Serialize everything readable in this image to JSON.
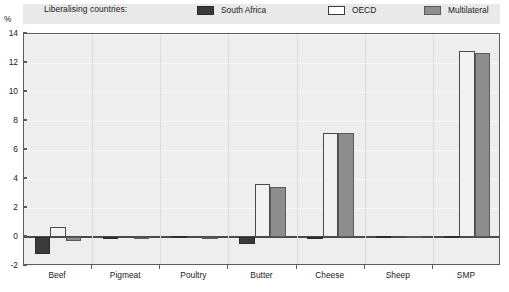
{
  "legend": {
    "title": "Liberalising countries:",
    "entries": [
      {
        "label": "South Africa",
        "swatch": "dark-filled-swatch",
        "color": "#3a3a3a"
      },
      {
        "label": "OECD",
        "swatch": "white-outlined-swatch",
        "color": "#ffffff"
      },
      {
        "label": "Multilateral",
        "swatch": "gray-filled-swatch",
        "color": "#8e8e8e"
      }
    ]
  },
  "axis": {
    "unit": "%",
    "y_ticks": [
      "14",
      "12",
      "10",
      "8",
      "6",
      "4",
      "2",
      "0",
      "-2"
    ]
  },
  "chart_data": {
    "type": "bar",
    "title": "",
    "xlabel": "",
    "ylabel": "%",
    "ylim": [
      -2,
      14
    ],
    "ytick_step": 2,
    "grid": true,
    "legend_position": "top",
    "categories": [
      "Beef",
      "Pigmeat",
      "Poultry",
      "Butter",
      "Cheese",
      "Sheep",
      "SMP"
    ],
    "series": [
      {
        "name": "South Africa",
        "color": "#3a3a3a",
        "values": [
          -1.2,
          -0.02,
          0.0,
          -0.5,
          -0.1,
          0.0,
          0.0
        ]
      },
      {
        "name": "OECD",
        "color": "#f2f2f2",
        "values": [
          0.7,
          0.0,
          0.0,
          3.65,
          7.15,
          0.0,
          12.8
        ]
      },
      {
        "name": "Multilateral",
        "color": "#8e8e8e",
        "values": [
          -0.3,
          -0.03,
          -0.15,
          3.45,
          7.15,
          0.0,
          12.7
        ]
      }
    ]
  }
}
